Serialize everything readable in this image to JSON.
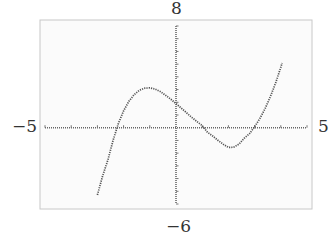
{
  "chart_data": {
    "type": "line",
    "title": "",
    "xlabel": "",
    "ylabel": "",
    "xlim": [
      -5,
      5
    ],
    "ylim": [
      -6,
      8
    ],
    "x_ticks_step": 1,
    "y_ticks_step": 1,
    "grid": false,
    "labels": {
      "ymax": "8",
      "ymin": "−6",
      "xmin": "−5",
      "xmax": "5"
    },
    "series": [
      {
        "name": "cubic",
        "style": "dotted",
        "roots": [
          -2.3,
          0.85,
          2.95
        ],
        "local_max": {
          "x": -1.07,
          "y": 3.1
        },
        "local_min": {
          "x": 2.0,
          "y": -1.5
        },
        "y_intercept": 1.9,
        "x": [
          -3.0,
          -2.8,
          -2.6,
          -2.4,
          -2.2,
          -2.0,
          -1.8,
          -1.6,
          -1.4,
          -1.2,
          -1.0,
          -0.8,
          -0.6,
          -0.4,
          -0.2,
          0.0,
          0.2,
          0.4,
          0.6,
          0.8,
          1.0,
          1.2,
          1.4,
          1.6,
          1.8,
          2.0,
          2.2,
          2.4,
          2.6,
          2.8,
          3.0,
          3.2,
          3.4,
          3.6,
          3.8,
          4.0,
          4.05
        ],
        "y": [
          -5.29,
          -3.8,
          -2.53,
          -0.99,
          0.34,
          1.32,
          2.07,
          2.6,
          2.94,
          3.11,
          3.13,
          3.04,
          2.84,
          2.56,
          2.24,
          1.9,
          1.54,
          1.18,
          0.82,
          0.48,
          0.17,
          -0.35,
          -0.65,
          -0.99,
          -1.3,
          -1.55,
          -1.53,
          -1.3,
          -0.84,
          -0.48,
          0.07,
          0.72,
          1.5,
          2.43,
          3.51,
          4.75,
          5.1
        ]
      }
    ]
  }
}
